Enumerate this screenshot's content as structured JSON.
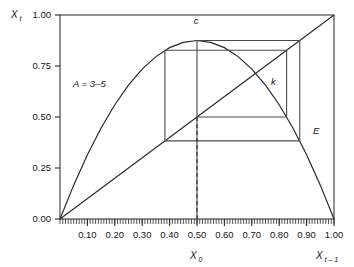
{
  "chart_data": {
    "type": "line",
    "title": "",
    "xlabel": "X t-1",
    "ylabel": "X t",
    "xlim": [
      0.0,
      1.0
    ],
    "ylim": [
      0.0,
      1.0
    ],
    "grid": false,
    "legend": "none",
    "axis_label_y": "X",
    "axis_label_y_sub": "t",
    "axis_label_x": "X",
    "axis_label_x_sub": "t – 1",
    "x_origin_label": "X",
    "x_origin_label_sub": "0",
    "yticks": [
      "0.00",
      "0.25",
      "0.50",
      "0.75",
      "1.00"
    ],
    "ytick_values": [
      0.0,
      0.25,
      0.5,
      0.75,
      1.0
    ],
    "xticks": [
      "0.10",
      "0.20",
      "0.30",
      "0.40",
      "0.50",
      "0.60",
      "0.70",
      "0.80",
      "0.90",
      "1.00"
    ],
    "xtick_values": [
      0.1,
      0.2,
      0.3,
      0.4,
      0.5,
      0.6,
      0.7,
      0.8,
      0.9,
      1.0
    ],
    "annotations": [
      {
        "text": "A = 3–5",
        "x": 0.16,
        "y": 0.62,
        "name": "parameter-annotation"
      },
      {
        "text": "c",
        "x": 0.51,
        "y": 0.93,
        "name": "point-label-c"
      },
      {
        "text": "k",
        "x": 0.79,
        "y": 0.715,
        "name": "point-label-k"
      },
      {
        "text": "E",
        "x": 0.925,
        "y": 0.405,
        "name": "point-label-e"
      }
    ],
    "series": [
      {
        "name": "logistic-map-parabola",
        "type": "line",
        "equation": "X_t = 3.5 * X_{t-1} * (1 - X_{t-1})",
        "parameter_A": 3.5,
        "x": [
          0.0,
          0.05,
          0.1,
          0.15,
          0.2,
          0.25,
          0.3,
          0.35,
          0.4,
          0.45,
          0.5,
          0.55,
          0.6,
          0.65,
          0.7,
          0.75,
          0.8,
          0.85,
          0.9,
          0.95,
          1.0
        ],
        "y": [
          0.0,
          0.166,
          0.315,
          0.446,
          0.56,
          0.656,
          0.735,
          0.796,
          0.84,
          0.866,
          0.875,
          0.866,
          0.84,
          0.796,
          0.735,
          0.656,
          0.56,
          0.446,
          0.315,
          0.166,
          0.0
        ]
      },
      {
        "name": "identity-diagonal",
        "type": "line",
        "equation": "X_t = X_{t-1}",
        "x": [
          0.0,
          1.0
        ],
        "y": [
          0.0,
          1.0
        ]
      },
      {
        "name": "cobweb-trajectory",
        "type": "line",
        "start_x": 0.5,
        "points": [
          [
            0.5,
            0.0
          ],
          [
            0.5,
            0.875
          ],
          [
            0.875,
            0.875
          ],
          [
            0.875,
            0.383
          ],
          [
            0.383,
            0.383
          ],
          [
            0.383,
            0.827
          ],
          [
            0.827,
            0.827
          ],
          [
            0.827,
            0.5
          ],
          [
            0.5,
            0.5
          ],
          [
            0.5,
            0.875
          ]
        ]
      }
    ],
    "key_points": [
      {
        "label": "c",
        "x": 0.5,
        "y": 0.875,
        "description": "maximum of parabola"
      },
      {
        "label": "k",
        "x": 0.714,
        "y": 0.714,
        "description": "fixed point intersection"
      },
      {
        "label": "E",
        "x": 0.9,
        "y": 0.383,
        "description": "cobweb corner"
      }
    ],
    "dashed_line": {
      "name": "x0-dropline",
      "x": 0.5,
      "y_from": 0.0,
      "y_to": 0.5
    }
  }
}
